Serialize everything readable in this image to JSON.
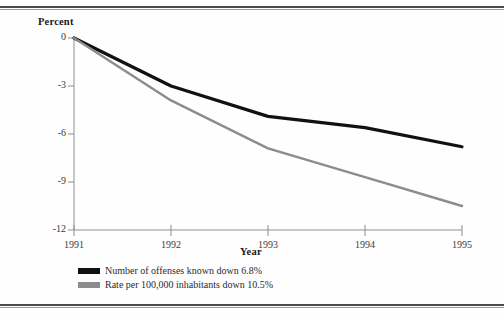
{
  "figure": {
    "axis_titles": {
      "y": "Percent",
      "x": "Year"
    },
    "legend": [
      {
        "label": "Number of offenses known down 6.8%",
        "swatch": "black-line-swatch",
        "color": "#111111"
      },
      {
        "label": "Rate per 100,000 inhabitants down 10.5%",
        "swatch": "gray-line-swatch",
        "color": "#8c8c8c"
      }
    ]
  },
  "chart_data": {
    "type": "line",
    "title": "",
    "xlabel": "Year",
    "ylabel": "Percent",
    "categories": [
      "1991",
      "1992",
      "1993",
      "1994",
      "1995"
    ],
    "x": [
      1991,
      1992,
      1993,
      1994,
      1995
    ],
    "xlim": [
      1991,
      1995
    ],
    "ylim": [
      -12,
      0
    ],
    "yticks": [
      0,
      -3,
      -6,
      -9,
      -12
    ],
    "ytick_labels": [
      "0",
      "-3",
      "-6",
      "-9",
      "-12"
    ],
    "xticks": [
      1991,
      1992,
      1993,
      1994,
      1995
    ],
    "xtick_labels": [
      "1991",
      "1992",
      "1993",
      "1994",
      "1995"
    ],
    "grid": false,
    "legend_position": "below-axes-left",
    "series": [
      {
        "name": "Number of offenses known down 6.8%",
        "color": "#111111",
        "values": [
          0.0,
          -3.0,
          -4.9,
          -5.6,
          -6.8
        ]
      },
      {
        "name": "Rate per 100,000 inhabitants down 10.5%",
        "color": "#8c8c8c",
        "values": [
          0.0,
          -3.9,
          -6.9,
          -8.7,
          -10.5
        ]
      }
    ]
  }
}
